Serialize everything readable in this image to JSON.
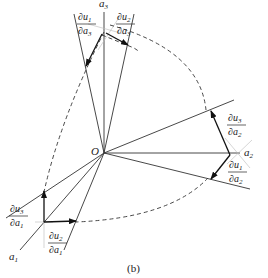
{
  "diagram": {
    "origin_label": "O",
    "axes": [
      {
        "id": "a1",
        "label": "a",
        "sub": "1"
      },
      {
        "id": "a2",
        "label": "a",
        "sub": "2"
      },
      {
        "id": "a3",
        "label": "a",
        "sub": "3"
      }
    ],
    "derivatives": [
      {
        "id": "du1-da3",
        "num": "∂u",
        "num_sub": "1",
        "den": "∂a",
        "den_sub": "3"
      },
      {
        "id": "du2-da3",
        "num": "∂u",
        "num_sub": "2",
        "den": "∂a",
        "den_sub": "3"
      },
      {
        "id": "du3-da2",
        "num": "∂u",
        "num_sub": "3",
        "den": "∂a",
        "den_sub": "2"
      },
      {
        "id": "du1-da2",
        "num": "∂u",
        "num_sub": "1",
        "den": "∂a",
        "den_sub": "2"
      },
      {
        "id": "du3-da1",
        "num": "∂u",
        "num_sub": "3",
        "den": "∂a",
        "den_sub": "1"
      },
      {
        "id": "du2-da1",
        "num": "∂u",
        "num_sub": "2",
        "den": "∂a",
        "den_sub": "1"
      }
    ],
    "caption": "(b)"
  }
}
